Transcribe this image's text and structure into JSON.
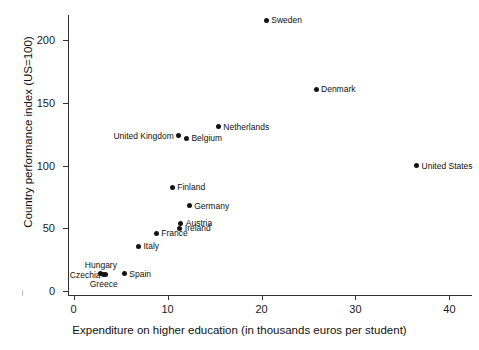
{
  "chart_data": {
    "type": "scatter",
    "title": "",
    "xlabel": "Expenditure on higher education (in thousands euros per student)",
    "ylabel": "Country performance index (US=100)",
    "xlim": [
      -0.6,
      42.4
    ],
    "ylim": [
      -3,
      220
    ],
    "xticks": [
      0,
      10,
      20,
      30,
      40
    ],
    "xtick_labels": [
      "0",
      "10",
      "20",
      "30",
      "40"
    ],
    "yticks": [
      0,
      50,
      100,
      150,
      200
    ],
    "ytick_labels": [
      "0",
      "50",
      "100",
      "150",
      "200"
    ],
    "grid": false,
    "legend": "none",
    "marker_color": "#141414",
    "axis_color": "#333333",
    "points": [
      {
        "label": "Sweden",
        "x": 20.5,
        "y": 216,
        "label_pos": "right"
      },
      {
        "label": "Denmark",
        "x": 25.8,
        "y": 161,
        "label_pos": "right"
      },
      {
        "label": "Netherlands",
        "x": 15.4,
        "y": 131,
        "label_pos": "right"
      },
      {
        "label": "United Kingdom",
        "x": 11.2,
        "y": 124,
        "label_pos": "left"
      },
      {
        "label": "Belgium",
        "x": 12.0,
        "y": 122,
        "label_pos": "right"
      },
      {
        "label": "United States",
        "x": 36.5,
        "y": 100,
        "label_pos": "right"
      },
      {
        "label": "Finland",
        "x": 10.5,
        "y": 83,
        "label_pos": "right"
      },
      {
        "label": "Germany",
        "x": 12.3,
        "y": 68,
        "label_pos": "right"
      },
      {
        "label": "Austria",
        "x": 11.4,
        "y": 54,
        "label_pos": "right"
      },
      {
        "label": "Ireland",
        "x": 11.3,
        "y": 50,
        "label_pos": "right"
      },
      {
        "label": "France",
        "x": 8.8,
        "y": 46,
        "label_pos": "right"
      },
      {
        "label": "Italy",
        "x": 6.9,
        "y": 36,
        "label_pos": "right"
      },
      {
        "label": "Spain",
        "x": 5.4,
        "y": 14,
        "label_pos": "right"
      },
      {
        "label": "Hungary",
        "x": 2.9,
        "y": 14,
        "label_pos": "above"
      },
      {
        "label": "Czechia",
        "x": 3.4,
        "y": 13,
        "label_pos": "left"
      },
      {
        "label": "Greece",
        "x": 3.2,
        "y": 13,
        "label_pos": "below"
      }
    ]
  }
}
